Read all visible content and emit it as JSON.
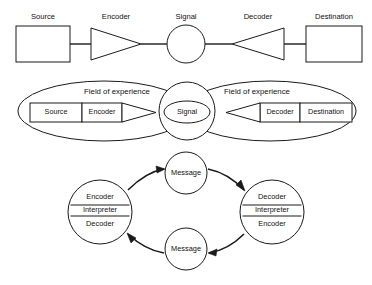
{
  "figure": {
    "background_color": "#ffffff",
    "line_color": "#1a1a1a"
  },
  "model_one": {
    "name": "linear transmission model",
    "source_label": "Source",
    "encoder_label": "Encoder",
    "signal_label": "Signal",
    "decoder_label": "Decoder",
    "destination_label": "Destination"
  },
  "model_two": {
    "name": "fields of experience model",
    "field_left_label": "Field of experience",
    "field_right_label": "Field of experience",
    "source_label": "Source",
    "encoder_label": "Encoder",
    "signal_label": "Signal",
    "decoder_label": "Decoder",
    "destination_label": "Destination"
  },
  "model_three": {
    "name": "circular interactive model",
    "left_node": {
      "top_label": "Encoder",
      "middle_label": "Interpreter",
      "bottom_label": "Decoder"
    },
    "right_node": {
      "top_label": "Decoder",
      "middle_label": "Interpreter",
      "bottom_label": "Encoder"
    },
    "message_top_label": "Message",
    "message_bottom_label": "Message"
  }
}
